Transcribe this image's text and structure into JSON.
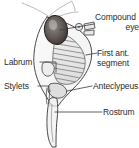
{
  "figure": {
    "kind": "anatomical-line-drawing",
    "background_color": "#ffffff",
    "ink_color": "#3a3a3a",
    "label_color": "#2b2b2b",
    "shading_color": "#b9b9b9",
    "eye_fill_color": "#4a4441"
  },
  "labels": {
    "compound_eye": {
      "line1": "Compound",
      "line2": "eye"
    },
    "first_ant_segment": {
      "line1": "First ant.",
      "line2": "segment"
    },
    "anteclypeus": "Anteclypeus",
    "rostrum": "Rostrum",
    "labrum": "Labrum",
    "stylets": "Stylets"
  },
  "parts": [
    {
      "name": "compound-eye",
      "side": "right"
    },
    {
      "name": "first-antennal-segment",
      "side": "right"
    },
    {
      "name": "anteclypeus",
      "side": "right"
    },
    {
      "name": "rostrum",
      "side": "right"
    },
    {
      "name": "labrum",
      "side": "left"
    },
    {
      "name": "stylets",
      "side": "left"
    }
  ]
}
